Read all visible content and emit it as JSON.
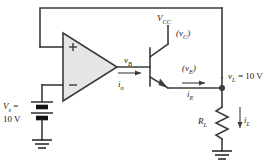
{
  "figure": {
    "type": "schematic",
    "width": 278,
    "height": 164,
    "colors": {
      "wire": "#3b3b3b",
      "opamp_fill": "#e6e6e6",
      "text": "#1a1a1a",
      "background": "#ffffff"
    }
  },
  "labels": {
    "vcc": {
      "base": "V",
      "sub": "CC"
    },
    "vc": {
      "text": "(v",
      "sub": "C",
      "close": ")"
    },
    "vb": {
      "base": "v",
      "sub": "B"
    },
    "io": {
      "base": "i",
      "sub": "o"
    },
    "ve": {
      "text": "(v",
      "sub": "E",
      "close": ")"
    },
    "ie": {
      "base": "i",
      "sub": "E"
    },
    "vl": {
      "base": "v",
      "sub": "L",
      "value": " = 10 V"
    },
    "rl": {
      "base": "R",
      "sub": "L"
    },
    "il": {
      "base": "i",
      "sub": "L"
    },
    "source_name": {
      "base": "V",
      "sub": "s",
      "eq": " ="
    },
    "source_value": "10 V"
  },
  "opamp": {
    "plus_terminal": "+",
    "minus_terminal": "−"
  },
  "components": {
    "transistor": "npn-bjt",
    "load_resistor": "R_L",
    "supply": "V_CC",
    "reference_source": "V_s = 10 V",
    "grounds": 2
  },
  "nodes": {
    "output_node": "v_L",
    "feedback": "output-to-noninverting-input"
  }
}
